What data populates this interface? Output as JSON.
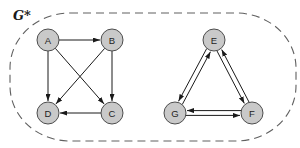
{
  "figure": {
    "label": "G*",
    "colors": {
      "node_fill": "#c9c9c9",
      "node_stroke": "#4d4d4d",
      "edge": "#1a1a1a",
      "boundary": "#606060",
      "background": "#ffffff"
    },
    "boundary": {
      "x": 10,
      "y": 13,
      "width": 286,
      "height": 128,
      "rx": 60,
      "ry": 55,
      "dash": "8 5"
    },
    "node_radius": 11,
    "pair_offset": 2.4,
    "nodes": [
      {
        "id": "A",
        "label": "A",
        "x": 48,
        "y": 40
      },
      {
        "id": "B",
        "label": "B",
        "x": 112,
        "y": 40
      },
      {
        "id": "C",
        "label": "C",
        "x": 112,
        "y": 113
      },
      {
        "id": "D",
        "label": "D",
        "x": 48,
        "y": 113
      },
      {
        "id": "E",
        "label": "E",
        "x": 214,
        "y": 40
      },
      {
        "id": "G",
        "label": "G",
        "x": 175,
        "y": 113
      },
      {
        "id": "F",
        "label": "F",
        "x": 252,
        "y": 113
      }
    ],
    "edges": [
      {
        "from": "A",
        "to": "B",
        "pair": false
      },
      {
        "from": "A",
        "to": "C",
        "pair": false
      },
      {
        "from": "A",
        "to": "D",
        "pair": false
      },
      {
        "from": "B",
        "to": "C",
        "pair": false
      },
      {
        "from": "B",
        "to": "D",
        "pair": false
      },
      {
        "from": "C",
        "to": "D",
        "pair": false
      },
      {
        "from": "E",
        "to": "G",
        "pair": true
      },
      {
        "from": "G",
        "to": "E",
        "pair": true
      },
      {
        "from": "E",
        "to": "F",
        "pair": true
      },
      {
        "from": "F",
        "to": "E",
        "pair": true
      },
      {
        "from": "G",
        "to": "F",
        "pair": true
      },
      {
        "from": "F",
        "to": "G",
        "pair": true
      }
    ]
  }
}
